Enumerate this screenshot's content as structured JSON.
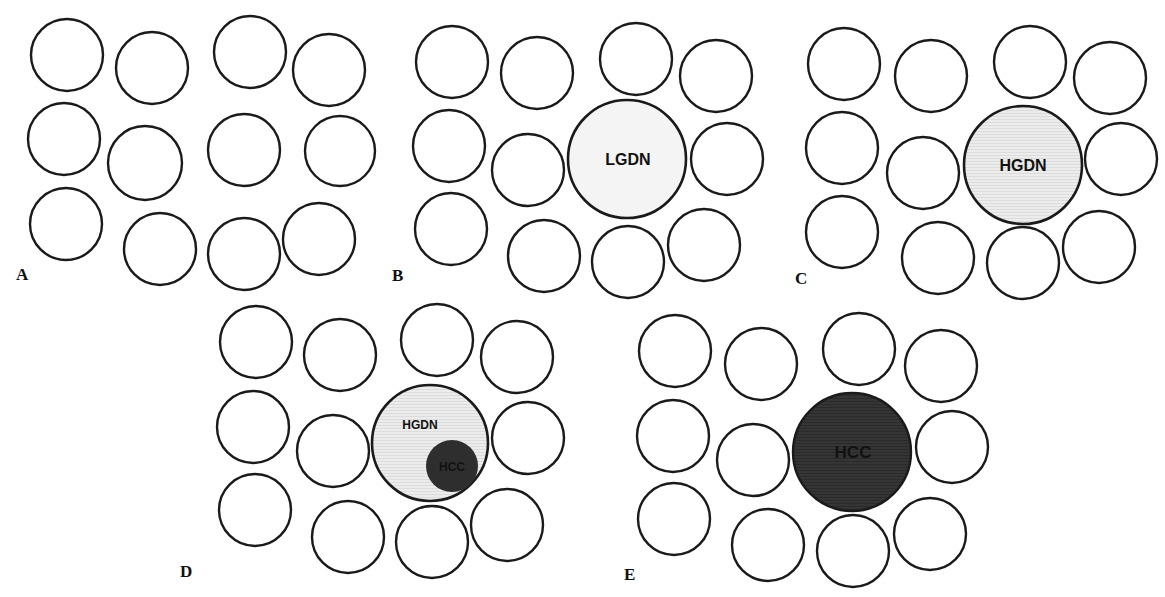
{
  "figure": {
    "colors": {
      "cell_stroke": "#1a1a1a",
      "cell_fill": "#ffffff",
      "lgdn_fill": "#f4f4f4",
      "hgdn_fill": "#e6e6e6",
      "hcc_fill": "#333333"
    },
    "panels": [
      {
        "id": "A",
        "label": "A",
        "lesion": null
      },
      {
        "id": "B",
        "label": "B",
        "lesion": "LGDN"
      },
      {
        "id": "C",
        "label": "C",
        "lesion": "HGDN"
      },
      {
        "id": "D",
        "label": "D",
        "lesion": "HGDN",
        "inner_lesion": "HCC"
      },
      {
        "id": "E",
        "label": "E",
        "lesion": "HCC"
      }
    ]
  }
}
